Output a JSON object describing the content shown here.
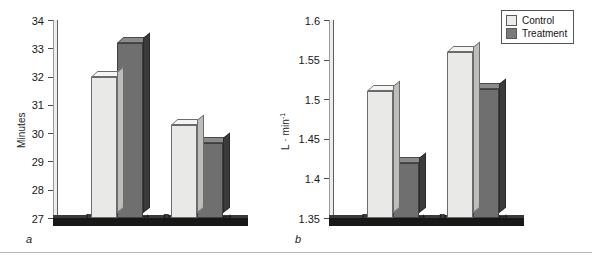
{
  "figure": {
    "panels": [
      {
        "letter": "a"
      },
      {
        "letter": "b"
      }
    ]
  },
  "legend": {
    "position": "top-right",
    "entries": [
      {
        "label": "Control",
        "swatch": "light-gray-swatch-icon",
        "color": "#ececea"
      },
      {
        "label": "Treatment",
        "swatch": "dark-gray-swatch-icon",
        "color": "#7a7a7a"
      }
    ]
  },
  "chart_data": [
    {
      "type": "bar",
      "panel": "a",
      "title": "",
      "xlabel": "",
      "ylabel": "Minutes",
      "ylabel_plain": "Minutes",
      "categories": [
        "Pretreatment",
        "Posttreatment"
      ],
      "series": [
        {
          "name": "Control",
          "values": [
            32.0,
            30.3
          ]
        },
        {
          "name": "Treatment",
          "values": [
            33.2,
            29.65
          ]
        }
      ],
      "ylim": [
        27,
        34
      ],
      "ytick_step": 1,
      "yticks": [
        27,
        28,
        29,
        30,
        31,
        32,
        33,
        34
      ],
      "ytick_labels": [
        "27",
        "28",
        "29",
        "30",
        "31",
        "32",
        "33",
        "34"
      ],
      "grid": false,
      "legend_position": "outside-top-right"
    },
    {
      "type": "bar",
      "panel": "b",
      "title": "",
      "xlabel": "",
      "ylabel": "L · min⁻¹",
      "ylabel_base": "L · min",
      "ylabel_superscript": "-1",
      "categories": [
        "Pretreatment",
        "Posttreatment"
      ],
      "series": [
        {
          "name": "Control",
          "values": [
            1.51,
            1.56
          ]
        },
        {
          "name": "Treatment",
          "values": [
            1.42,
            1.513
          ]
        }
      ],
      "ylim": [
        1.35,
        1.6
      ],
      "ytick_step": 0.05,
      "yticks": [
        1.35,
        1.4,
        1.45,
        1.5,
        1.55,
        1.6
      ],
      "ytick_labels": [
        "1.35",
        "1.4",
        "1.45",
        "1.5",
        "1.55",
        "1.6"
      ],
      "grid": false,
      "legend_position": "outside-top-right"
    }
  ]
}
